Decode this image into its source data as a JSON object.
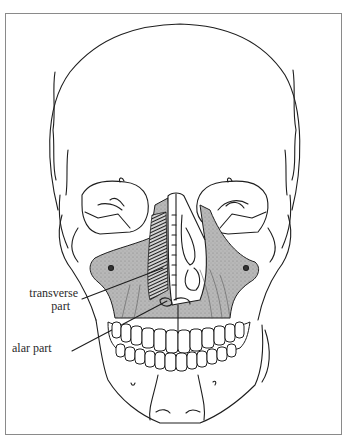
{
  "figure": {
    "labels": [
      {
        "id": "transverse",
        "line1": "transverse",
        "line2": "part"
      },
      {
        "id": "alar",
        "line1": "alar part"
      }
    ],
    "colors": {
      "outline": "#1e1e1e",
      "shade": "#b8b8b8",
      "frame": "#8a8a8a",
      "background": "#ffffff"
    }
  }
}
